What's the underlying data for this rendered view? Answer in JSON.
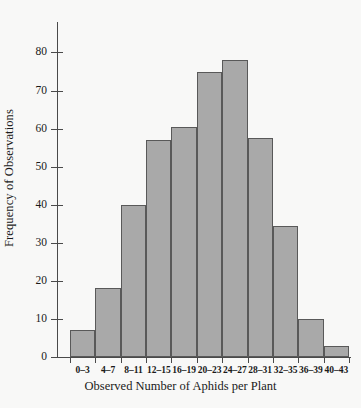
{
  "chart_data": {
    "type": "bar",
    "title": "",
    "xlabel": "Observed Number of Aphids per Plant",
    "ylabel": "Frequency of Observations",
    "categories": [
      "0–3",
      "4–7",
      "8–11",
      "12–15",
      "16–19",
      "20–23",
      "24–27",
      "28–31",
      "32–35",
      "36–39",
      "40–43"
    ],
    "values": [
      7,
      18,
      40,
      57,
      60.5,
      75,
      78,
      57.5,
      34.5,
      10,
      3
    ],
    "ylim": [
      0,
      88
    ],
    "yticks": [
      0,
      10,
      20,
      30,
      40,
      50,
      60,
      70,
      80
    ],
    "ytick_labels": [
      "0",
      "10",
      "20",
      "30",
      "40",
      "50",
      "60",
      "70",
      "80"
    ],
    "grid": false,
    "legend": null,
    "bar_color": "#a9a9a9",
    "bar_edge_color": "#595959",
    "axis_color": "#4a4a4a",
    "background_color": "#f8f8f7"
  }
}
